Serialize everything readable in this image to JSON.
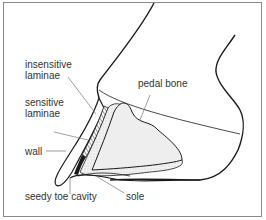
{
  "diagram": {
    "labels": {
      "insensitive_laminae_1": "insensitive",
      "insensitive_laminae_2": "laminae",
      "sensitive_laminae_1": "sensitive",
      "sensitive_laminae_2": "laminae",
      "wall": "wall",
      "pedal_bone": "pedal bone",
      "seedy_toe_cavity": "seedy toe cavity",
      "sole": "sole"
    },
    "colors": {
      "outline": "#1a1a1a",
      "leader": "#777777",
      "frame": "#8a8a8a",
      "bone_fill": "#e6e6e6"
    }
  }
}
